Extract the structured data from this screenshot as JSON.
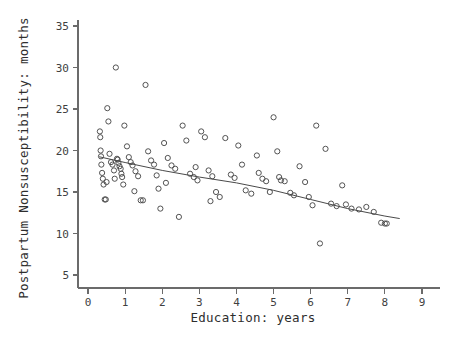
{
  "chart_data": {
    "type": "scatter",
    "title": "",
    "xlabel": "Education: years",
    "ylabel": "Postpartum Nonsusceptibility: months",
    "xlim": [
      0,
      9
    ],
    "ylim": [
      5,
      35
    ],
    "xticks": [
      0,
      1,
      2,
      3,
      4,
      5,
      6,
      7,
      8,
      9
    ],
    "yticks": [
      5,
      10,
      15,
      20,
      25,
      30,
      35
    ],
    "grid": false,
    "legend": "none",
    "point_marker": "open-circle",
    "series": [
      {
        "name": "observations",
        "points": [
          [
            0.32,
            22.3
          ],
          [
            0.33,
            21.6
          ],
          [
            0.35,
            19.3
          ],
          [
            0.36,
            18.3
          ],
          [
            0.38,
            17.3
          ],
          [
            0.4,
            16.6
          ],
          [
            0.42,
            15.9
          ],
          [
            0.45,
            14.1
          ],
          [
            0.48,
            14.1
          ],
          [
            0.52,
            25.1
          ],
          [
            0.55,
            23.5
          ],
          [
            0.58,
            19.6
          ],
          [
            0.62,
            18.6
          ],
          [
            0.66,
            18.3
          ],
          [
            0.7,
            17.6
          ],
          [
            0.72,
            16.6
          ],
          [
            0.75,
            30.0
          ],
          [
            0.78,
            19.0
          ],
          [
            0.8,
            18.9
          ],
          [
            0.82,
            18.5
          ],
          [
            0.85,
            18.1
          ],
          [
            0.88,
            17.8
          ],
          [
            0.92,
            16.8
          ],
          [
            0.95,
            15.9
          ],
          [
            0.98,
            23.0
          ],
          [
            1.05,
            20.5
          ],
          [
            1.1,
            19.2
          ],
          [
            1.15,
            18.6
          ],
          [
            1.2,
            18.2
          ],
          [
            1.28,
            17.5
          ],
          [
            1.35,
            16.9
          ],
          [
            1.42,
            14.0
          ],
          [
            1.48,
            14.0
          ],
          [
            1.55,
            27.9
          ],
          [
            1.62,
            19.9
          ],
          [
            1.7,
            18.8
          ],
          [
            1.78,
            18.3
          ],
          [
            1.85,
            17.0
          ],
          [
            1.95,
            13.0
          ],
          [
            2.05,
            20.9
          ],
          [
            2.15,
            19.1
          ],
          [
            2.25,
            18.2
          ],
          [
            2.35,
            17.8
          ],
          [
            2.45,
            12.0
          ],
          [
            2.55,
            23.0
          ],
          [
            2.65,
            21.2
          ],
          [
            2.75,
            17.2
          ],
          [
            2.85,
            16.8
          ],
          [
            2.95,
            16.4
          ],
          [
            3.05,
            22.3
          ],
          [
            3.15,
            21.6
          ],
          [
            3.25,
            17.6
          ],
          [
            3.35,
            16.9
          ],
          [
            3.45,
            15.0
          ],
          [
            3.55,
            14.4
          ],
          [
            3.7,
            21.5
          ],
          [
            3.85,
            17.1
          ],
          [
            3.95,
            16.7
          ],
          [
            4.05,
            20.6
          ],
          [
            4.15,
            18.3
          ],
          [
            4.25,
            15.2
          ],
          [
            4.4,
            14.8
          ],
          [
            4.55,
            19.4
          ],
          [
            4.7,
            16.6
          ],
          [
            4.8,
            16.3
          ],
          [
            4.9,
            15.0
          ],
          [
            5.0,
            24.0
          ],
          [
            5.1,
            19.9
          ],
          [
            5.2,
            16.4
          ],
          [
            5.3,
            16.3
          ],
          [
            5.45,
            14.9
          ],
          [
            5.55,
            14.6
          ],
          [
            5.7,
            18.1
          ],
          [
            5.85,
            16.2
          ],
          [
            5.95,
            14.4
          ],
          [
            6.05,
            13.4
          ],
          [
            6.15,
            23.0
          ],
          [
            6.25,
            8.8
          ],
          [
            6.4,
            20.2
          ],
          [
            6.55,
            13.6
          ],
          [
            6.7,
            13.3
          ],
          [
            6.85,
            15.8
          ],
          [
            6.95,
            13.5
          ],
          [
            7.1,
            13.0
          ],
          [
            7.3,
            12.9
          ],
          [
            7.5,
            13.2
          ],
          [
            7.7,
            12.6
          ],
          [
            7.9,
            11.3
          ],
          [
            8.0,
            11.2
          ],
          [
            8.05,
            11.2
          ],
          [
            0.34,
            20.0
          ],
          [
            0.5,
            16.2
          ],
          [
            0.9,
            17.2
          ],
          [
            1.25,
            15.1
          ],
          [
            2.1,
            16.1
          ],
          [
            2.9,
            18.0
          ],
          [
            4.6,
            17.3
          ],
          [
            5.15,
            16.8
          ],
          [
            1.9,
            15.4
          ],
          [
            3.3,
            13.9
          ]
        ]
      }
    ],
    "fit_line": {
      "name": "smoothed-fit",
      "points": [
        [
          0.3,
          19.25
        ],
        [
          1.0,
          18.55
        ],
        [
          2.0,
          17.6
        ],
        [
          3.0,
          16.8
        ],
        [
          4.0,
          16.1
        ],
        [
          5.0,
          15.2
        ],
        [
          6.0,
          14.1
        ],
        [
          7.0,
          13.0
        ],
        [
          8.0,
          12.1
        ],
        [
          8.4,
          11.8
        ]
      ]
    }
  }
}
